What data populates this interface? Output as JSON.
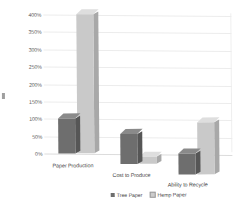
{
  "chart_data": {
    "type": "bar",
    "title": "",
    "subtitle": "",
    "xlabel": "",
    "ylabel": "",
    "categories": [
      "Paper Production",
      "Cost to Produce",
      "Ability to Recycle"
    ],
    "series": [
      {
        "name": "Tree Paper",
        "color": "#6e6e6e",
        "values": [
          100,
          85,
          60
        ]
      },
      {
        "name": "Hemp Paper",
        "color": "#c9c9c9",
        "values": [
          400,
          20,
          150
        ]
      }
    ],
    "ylim": [
      0,
      400
    ],
    "ytick_values": [
      0,
      50,
      100,
      150,
      200,
      250,
      300,
      350,
      400
    ],
    "ytick_labels": [
      "0%",
      "50%",
      "100%",
      "150%",
      "200%",
      "250%",
      "300%",
      "350%",
      "400%"
    ],
    "grid": true,
    "legend_position": "bottom",
    "style": "3d-column",
    "annotations": []
  },
  "legend": {
    "items": [
      {
        "label": "Tree Paper",
        "swatch": "tree-swatch"
      },
      {
        "label": "Hemp Paper",
        "swatch": "hemp-swatch"
      }
    ]
  },
  "colors": {
    "tree_paper": "#6e6e6e",
    "hemp_paper": "#c9c9c9",
    "gridline": "#ececec",
    "background": "#ffffff",
    "text": "#3f3f3f"
  }
}
